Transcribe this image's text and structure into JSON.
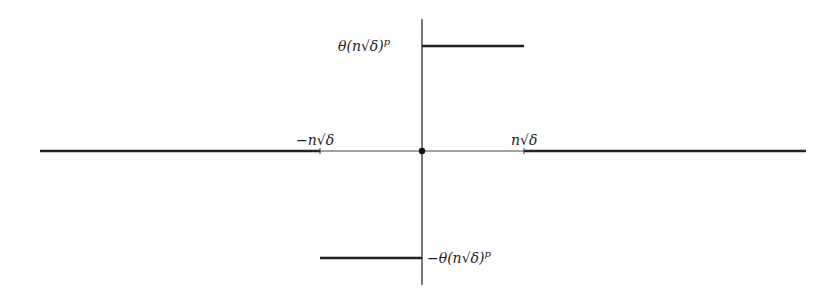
{
  "diagram": {
    "type": "piecewise-function-plot",
    "labels": {
      "upper_value": "θ(n√δ)",
      "upper_exponent": "p",
      "lower_value": "−θ(n√δ)",
      "lower_exponent": "p",
      "neg_tick": "−n√δ",
      "pos_tick": "n√δ"
    },
    "segments": [
      {
        "name": "left-flat",
        "from_x": "-inf",
        "to_x": "-n√δ",
        "y": 0
      },
      {
        "name": "lower-step",
        "from_x": "-n√δ",
        "to_x": 0,
        "y": "-θ(n√δ)^p"
      },
      {
        "name": "upper-step",
        "from_x": 0,
        "to_x": "n√δ",
        "y": "θ(n√δ)^p"
      },
      {
        "name": "right-flat",
        "from_x": "n√δ",
        "to_x": "inf",
        "y": 0
      }
    ],
    "origin_point": true,
    "colors": {
      "line": "#222222",
      "axis": "#333333"
    }
  }
}
